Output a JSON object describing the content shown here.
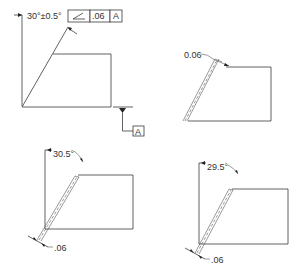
{
  "figures": [
    {
      "id": "top-left",
      "angle_label": "30°±0.5°",
      "fcf": {
        "symbol": "angularity-icon",
        "tolerance": ".06",
        "datum": "A"
      },
      "datum_label": "A"
    },
    {
      "id": "top-right",
      "zone_label": "0.06"
    },
    {
      "id": "bottom-left",
      "angle_label": "30.5°",
      "zone_label": ".06"
    },
    {
      "id": "bottom-right",
      "angle_label": "29.5°",
      "zone_label": ".06"
    }
  ]
}
